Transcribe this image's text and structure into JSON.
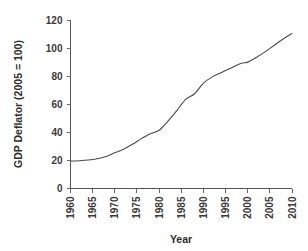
{
  "chart_data": {
    "type": "line",
    "title": "",
    "subtitle": "",
    "xlabel": "Year",
    "ylabel": "GDP Deflator (2005 = 100)",
    "xlim": [
      1960,
      2010
    ],
    "ylim": [
      0,
      120
    ],
    "xticks": [
      1960,
      1965,
      1970,
      1975,
      1980,
      1985,
      1990,
      1995,
      2000,
      2005,
      2010
    ],
    "xtick_labels": [
      "1960",
      "1965",
      "1970",
      "1975",
      "1980",
      "1985",
      "1990",
      "1995",
      "2000",
      "2005",
      "2010"
    ],
    "yticks": [
      0,
      20,
      40,
      60,
      80,
      100,
      120
    ],
    "ytick_labels": [
      "0",
      "20",
      "40",
      "60",
      "80",
      "100",
      "120"
    ],
    "grid": false,
    "legend": false,
    "legend_position": "none",
    "x_tick_label_rotation": -90,
    "line_color": "#4a4a4a",
    "axis_color": "#555555",
    "background_color": "#ffffff",
    "series": [
      {
        "name": "GDP Deflator",
        "x": [
          1960,
          1962,
          1964,
          1966,
          1968,
          1970,
          1972,
          1974,
          1976,
          1978,
          1980,
          1982,
          1984,
          1986,
          1988,
          1990,
          1992,
          1994,
          1996,
          1998,
          1999,
          2000,
          2002,
          2004,
          2006,
          2008,
          2010
        ],
        "values": [
          19.5,
          19.8,
          20.3,
          21.2,
          22.8,
          25.5,
          28.0,
          31.5,
          35.5,
          39.0,
          41.5,
          48.0,
          55.5,
          63.5,
          67.5,
          75.0,
          79.5,
          82.5,
          85.5,
          88.5,
          89.5,
          90.0,
          93.5,
          97.5,
          102.0,
          106.5,
          110.5
        ]
      }
    ]
  },
  "axis": {
    "y_title": "GDP Deflator (2005 = 100)",
    "x_title": "Year"
  }
}
